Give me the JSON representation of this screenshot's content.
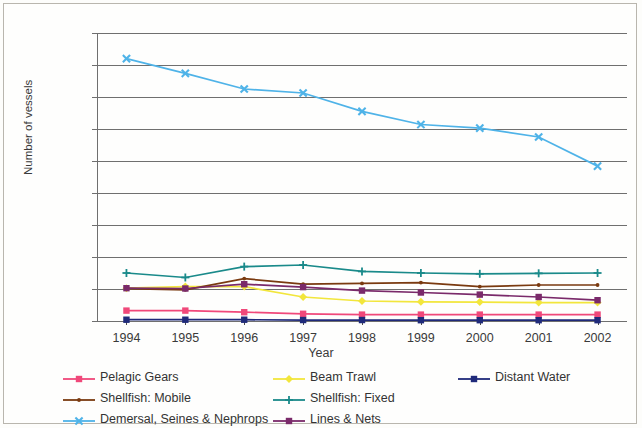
{
  "chart_data": {
    "type": "line",
    "title": "",
    "xlabel": "Year",
    "ylabel": "Number of vessels",
    "categories": [
      "1994",
      "1995",
      "1996",
      "1997",
      "1998",
      "1999",
      "2000",
      "2001",
      "2002"
    ],
    "x": [
      1994,
      1995,
      1996,
      1997,
      1998,
      1999,
      2000,
      2001,
      2002
    ],
    "ylim": [
      0,
      1800
    ],
    "ytick_step": 200,
    "yticks": [
      "1800",
      "1600",
      "1400",
      "1200",
      "1000",
      "800",
      "600",
      "400",
      "200",
      "0"
    ],
    "grid": "horizontal",
    "legend_position": "bottom",
    "series": [
      {
        "name": "Pelagic Gears",
        "color": "#F0487A",
        "marker": "square",
        "values": [
          65,
          65,
          55,
          45,
          40,
          40,
          40,
          40,
          40
        ]
      },
      {
        "name": "Beam Trawl",
        "color": "#F2E63C",
        "marker": "diamond",
        "values": [
          205,
          215,
          215,
          150,
          125,
          120,
          118,
          115,
          115
        ]
      },
      {
        "name": "Distant Water",
        "color": "#1F2A7A",
        "marker": "square",
        "values": [
          8,
          8,
          8,
          6,
          6,
          5,
          5,
          5,
          5
        ]
      },
      {
        "name": "Shellfish: Mobile",
        "color": "#7A3A10",
        "marker": "dot",
        "values": [
          202,
          195,
          265,
          230,
          235,
          240,
          215,
          225,
          225
        ]
      },
      {
        "name": "Shellfish: Fixed",
        "color": "#1A8A8A",
        "marker": "plus",
        "values": [
          300,
          272,
          340,
          350,
          310,
          300,
          295,
          298,
          300
        ]
      },
      {
        "name": "Demersal, Seines & Nephrops",
        "color": "#4FB3E8",
        "marker": "cross",
        "values": [
          1640,
          1548,
          1450,
          1425,
          1310,
          1228,
          1205,
          1150,
          968
        ]
      },
      {
        "name": "Lines & Nets",
        "color": "#7A2A6A",
        "marker": "square",
        "values": [
          205,
          203,
          230,
          212,
          190,
          178,
          165,
          150,
          130
        ]
      }
    ]
  },
  "legend": {
    "columns": [
      [
        "Pelagic Gears",
        "Shellfish: Mobile",
        "Demersal, Seines & Nephrops"
      ],
      [
        "Beam Trawl",
        "Shellfish: Fixed",
        "Lines & Nets"
      ],
      [
        "Distant Water"
      ]
    ]
  }
}
